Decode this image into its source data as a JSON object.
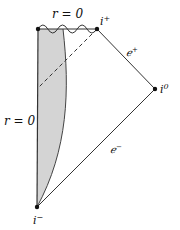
{
  "diagram": {
    "type": "penrose-diagram",
    "labels": {
      "singularity": "r = 0",
      "axis": "r = 0",
      "future_timelike_infinity": "i",
      "future_timelike_sup": "+",
      "spatial_infinity": "i",
      "spatial_sup": "0",
      "past_timelike_infinity": "i",
      "past_timelike_sup": "−",
      "future_null_infinity": "ℯ",
      "future_null_sup": "+",
      "past_null_infinity": "ℯ",
      "past_null_sup": "−"
    },
    "colors": {
      "line": "#333333",
      "shade": "#d4d4d4",
      "dot": "#111111"
    }
  }
}
